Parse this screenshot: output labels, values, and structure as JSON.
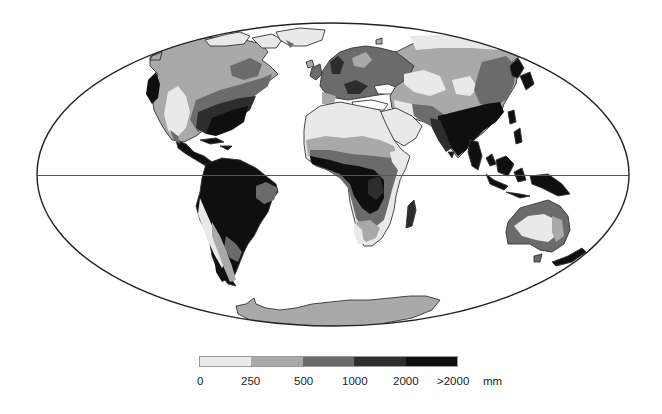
{
  "map": {
    "projection": "Mollweide (world)",
    "subject": "Annual precipitation",
    "colors": {
      "band_0_250": "#e9e9e9",
      "band_250_500": "#a9a9a9",
      "band_500_1000": "#6b6b6b",
      "band_1000_2000": "#2d2d2d",
      "band_over_2000": "#0f0f0f",
      "outline": "#222222",
      "equator": "#555555"
    }
  },
  "legend": {
    "items": [
      {
        "range": "0-250",
        "color": "#e9e9e9"
      },
      {
        "range": "250-500",
        "color": "#a9a9a9"
      },
      {
        "range": "500-1000",
        "color": "#6b6b6b"
      },
      {
        "range": "1000-2000",
        "color": "#2d2d2d"
      },
      {
        "range": ">2000",
        "color": "#0f0f0f"
      }
    ],
    "tick_labels": [
      "0",
      "250",
      "500",
      "1000",
      "2000",
      ">2000"
    ],
    "unit": "mm"
  }
}
